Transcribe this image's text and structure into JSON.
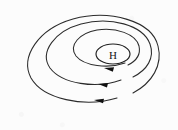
{
  "figure": {
    "name": "high-pressure-system-diagram",
    "background_color": "#fcfcfc",
    "line_color": "#2b2b2b",
    "arrow_color": "#111111",
    "center_label": "H",
    "center_label_name": "high-pressure-center-label",
    "center_ellipse": {
      "cx": 113,
      "cy": 54,
      "rx": 17,
      "ry": 10
    },
    "isobars": [
      {
        "id": "isobar-inner",
        "path": "M 125 63 C 108 69 84 66 76 56 C 68 45 80 33 97 30 C 116 27 136 34 139 46 C 141 55 136 61 128 65"
      },
      {
        "id": "isobar-middle",
        "path": "M 121 80 C 96 89 62 84 50 68 C 39 52 55 31 81 24 C 110 16 143 25 150 44 C 155 58 147 70 133 77"
      },
      {
        "id": "isobar-outer",
        "path": "M 117 98 C 84 108 43 99 31 78 C 20 57 38 29 73 19 C 110 9 152 21 158 46 C 163 65 152 83 133 93"
      }
    ],
    "arrows": [
      {
        "id": "flow-arrow-inner",
        "tip_x": 104,
        "tip_y": 68,
        "angle": 196
      },
      {
        "id": "flow-arrow-middle",
        "tip_x": 98,
        "tip_y": 84,
        "angle": 194
      },
      {
        "id": "flow-arrow-outer",
        "tip_x": 94,
        "tip_y": 100,
        "angle": 192
      }
    ]
  },
  "chart_data": {
    "type": "diagram",
    "symbols": [
      {
        "label": "H",
        "meaning": "high-pressure-center",
        "x": 113,
        "y": 54
      }
    ],
    "contours": 3,
    "flow_direction": "clockwise-outward",
    "arrow_count": 3
  }
}
